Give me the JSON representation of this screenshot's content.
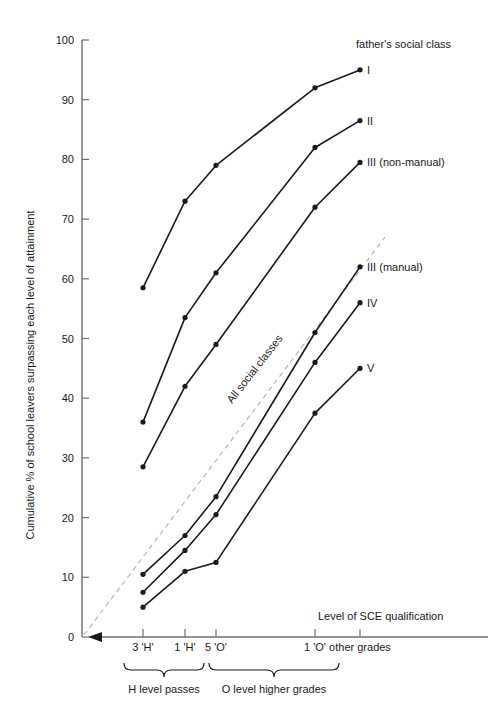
{
  "chart_data": {
    "type": "line",
    "title": "",
    "ylabel": "Cumulative % of school leavers surpassing each level of attainment",
    "xlabel": "Level of SCE qualification",
    "ylim": [
      0,
      100
    ],
    "y_ticks": [
      0,
      10,
      20,
      30,
      40,
      50,
      60,
      70,
      80,
      90,
      100
    ],
    "grid": false,
    "legend_position": "right-end-of-line",
    "legend_title": "father's social class",
    "x_categories": [
      "3 'H'",
      "1 'H'",
      "5 'O'",
      "1 'O'",
      "other grades"
    ],
    "x_tick_labels": [
      "3 'H'",
      "1 'H'",
      "5 'O'",
      "1 'O'",
      "other grades"
    ],
    "annotations": [
      {
        "text": "All social classes",
        "kind": "dashed-reference-line"
      },
      {
        "text": "H level passes",
        "kind": "brace",
        "spans": [
          "3 'H'",
          "1 'H'"
        ]
      },
      {
        "text": "O level higher grades",
        "kind": "brace",
        "spans": [
          "5 'O'",
          "1 'O'"
        ]
      },
      {
        "text": "Level of SCE qualification",
        "kind": "axis-title"
      }
    ],
    "series": [
      {
        "name": "I",
        "label": "I",
        "x": [
          "3 'H'",
          "1 'H'",
          "5 'O'",
          "1 'O'",
          "other grades"
        ],
        "values": [
          58.5,
          73,
          79,
          92,
          95
        ]
      },
      {
        "name": "II",
        "label": "II",
        "x": [
          "3 'H'",
          "1 'H'",
          "5 'O'",
          "1 'O'",
          "other grades"
        ],
        "values": [
          36,
          53.5,
          61,
          82,
          86.5
        ]
      },
      {
        "name": "III (non-manual)",
        "label": "III (non-manual)",
        "x": [
          "3 'H'",
          "1 'H'",
          "5 'O'",
          "1 'O'",
          "other grades"
        ],
        "values": [
          28.5,
          42,
          49,
          72,
          79.5
        ]
      },
      {
        "name": "III (manual)",
        "label": "III  (manual)",
        "x": [
          "3 'H'",
          "1 'H'",
          "5 'O'",
          "1 'O'",
          "other grades"
        ],
        "values": [
          10.5,
          17,
          23.5,
          51,
          62
        ]
      },
      {
        "name": "IV",
        "label": "IV",
        "x": [
          "3 'H'",
          "1 'H'",
          "5 'O'",
          "1 'O'",
          "other grades"
        ],
        "values": [
          7.5,
          14.5,
          20.5,
          46,
          56
        ]
      },
      {
        "name": "V",
        "label": "V",
        "x": [
          "3 'H'",
          "1 'H'",
          "5 'O'",
          "1 'O'",
          "other grades"
        ],
        "values": [
          5,
          11,
          12.5,
          37.5,
          45
        ]
      }
    ],
    "reference_line": {
      "name": "All social classes",
      "from": [
        0,
        0
      ],
      "to": [
        100,
        67
      ]
    }
  },
  "axes": {
    "y_title": "Cumulative % of school leavers surpassing each level of attainment",
    "x_title": "Level of SCE qualification",
    "y_tick_labels": [
      "100",
      "90",
      "80",
      "70",
      "60",
      "50",
      "40",
      "30",
      "20",
      "10",
      "0"
    ],
    "x_tick_labels": [
      "3 'H'",
      "1 'H'",
      "5 'O'",
      "1 'O'",
      "other grades"
    ]
  },
  "legend": {
    "title": "father's social class",
    "entries": [
      "I",
      "II",
      "III (non-manual)",
      "III  (manual)",
      "IV",
      "V"
    ]
  },
  "braces": {
    "left_label": "H level passes",
    "right_label": "O level higher grades"
  },
  "reference": {
    "label": "All social classes"
  },
  "colors": {
    "line": "#1a1a1a",
    "axis": "#6e6e6e",
    "dashed": "#9a9a9a",
    "text": "#1a1a1a",
    "background": "#ffffff"
  }
}
